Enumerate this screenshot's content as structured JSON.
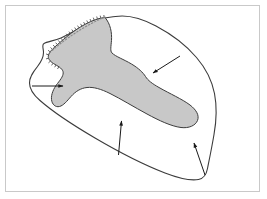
{
  "figure": {
    "domain_label": "Diagram",
    "title": "",
    "caption": "",
    "background_color": "#ffffff",
    "frame": {
      "name": "figure-border",
      "stroke_color": "#c9c9c9",
      "stroke_width": 1,
      "x": 5,
      "y": 5,
      "width": 255,
      "height": 187
    },
    "outline": {
      "name": "outer-region-outline",
      "description": "irregular closed blob outline",
      "stroke_color": "#3c3c3c",
      "stroke_width": 1.1,
      "fill_color": "none",
      "path": "M 115.5 16.5 C 128 14.5 142 18.5 156 26.0 C 172 34.5 186 45.0 196.5 57.5 C 206 68.5 212 81.0 214.5 93.5 C 217 106.5 216.5 120.5 214.0 134.5 C 212.0 146.5 209.5 158.5 207.5 168.5 C 206.5 174.0 204.0 178.5 198.5 179.5 C 190.0 181.0 178.0 178.0 165.0 173.0 C 143.0 164.5 118.0 151.5 95.0 138.0 C 72.0 124.5 52.0 111.0 40.0 100.5 C 33.0 94.5 29.5 89.0 29.5 83.0 C 29.5 76.5 33.5 71.5 37.5 66.5 C 41.0 62.0 43.5 57.5 43.5 52.5 C 43.5 48.5 41.5 45.0 44.0 43.5 C 47.0 41.5 54.0 41.0 61.0 38.0 C 72.0 33.0 83.0 26.0 93.5 21.0 C 100.5 17.8 108.0 17.7 115.5 16.5 Z"
    },
    "shaded_region": {
      "name": "shaded-inner-region",
      "description": "gray filled elongated lobe extending from upper-left to right tip",
      "fill_color": "#c8c8c8",
      "stroke_color": "#3c3c3c",
      "stroke_width": 1.0,
      "path": "M 105.0 17.5 C 110.5 24.0 112.0 32.5 111.5 40.5 C 111.0 46.5 110.0 51.0 112.0 53.0 C 115.5 56.5 124.0 59.5 131.5 64.0 C 138.5 68.2 143.0 72.5 145.5 76.5 C 148.0 80.5 152.0 83.5 159.0 87.5 C 170.0 93.8 182.0 99.0 190.0 105.0 C 196.5 110.0 199.5 115.5 197.5 120.5 C 195.5 125.5 189.0 128.5 181.0 127.5 C 171.0 126.2 159.0 120.5 147.0 114.0 C 134.0 107.0 121.0 99.0 110.0 93.5 C 101.0 89.0 93.5 86.8 87.0 87.5 C 80.5 88.2 75.5 91.5 71.0 96.5 C 67.0 101.0 63.5 105.5 59.5 106.5 C 55.5 107.5 52.0 104.5 51.5 99.5 C 51.0 94.5 53.5 88.5 57.5 83.5 C 61.0 79.0 64.0 75.0 63.0 71.5 C 62.0 68.0 57.5 66.0 53.5 63.5 C 50.0 61.3 47.5 58.5 48.5 55.0 C 49.3 52.2 52.0 49.5 55.0 46.8 C 58.5 43.6 62.5 40.2 67.0 36.5 C 78.0 27.5 93.0 18.5 105.0 17.5 Z"
    },
    "dotted_boundary": {
      "name": "dotted-boundary-segment",
      "description": "dotted line marking uncertain/inferred boundary along the upper-left edge",
      "stroke_color": "#8a8a8a",
      "stroke_width": 1.1,
      "dash_pattern": "1.4 2.0",
      "path": "M 105.0 17.0 C 92.0 22.5 78.5 30.5 68.0 38.0 C 60.0 43.8 53.5 49.0 49.5 53.0"
    },
    "serrated_edge": {
      "name": "serrated-region-edge",
      "description": "hatched/ticked edge along the top-left margin of the shaded lobe",
      "stroke_color": "#555555",
      "stroke_width": 0.9,
      "tick_count": 26
    },
    "arrows": [
      {
        "name": "arrow-left",
        "label": "",
        "direction": "right",
        "stroke_color": "#1a1a1a",
        "stroke_width": 1.0,
        "x1": 32.0,
        "y1": 86.0,
        "x2": 63.0,
        "y2": 86.0
      },
      {
        "name": "arrow-top-right",
        "label": "",
        "direction": "down-left",
        "stroke_color": "#1a1a1a",
        "stroke_width": 1.0,
        "x1": 180.0,
        "y1": 56.0,
        "x2": 153.0,
        "y2": 73.0
      },
      {
        "name": "arrow-bottom-center",
        "label": "",
        "direction": "up",
        "stroke_color": "#1a1a1a",
        "stroke_width": 1.0,
        "x1": 118.5,
        "y1": 155.0,
        "x2": 121.5,
        "y2": 121.0
      },
      {
        "name": "arrow-bottom-right",
        "label": "",
        "direction": "up-left",
        "stroke_color": "#1a1a1a",
        "stroke_width": 1.0,
        "x1": 205.0,
        "y1": 175.0,
        "x2": 194.0,
        "y2": 143.0
      }
    ]
  }
}
